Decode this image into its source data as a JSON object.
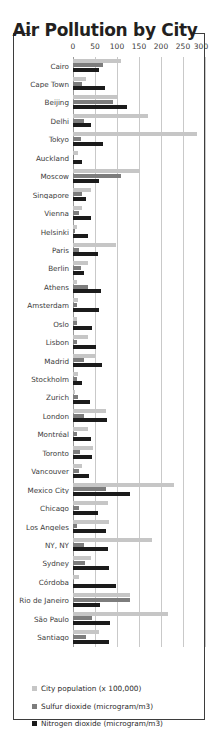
{
  "chart_data": {
    "type": "bar",
    "orientation": "horizontal",
    "title": "Air Pollution by City",
    "xlabel": "",
    "ylabel": "",
    "xlim": [
      0,
      300
    ],
    "xticks": [
      0,
      50,
      100,
      150,
      200,
      250,
      300
    ],
    "grid": true,
    "legend_position": "bottom",
    "categories": [
      "Cairo",
      "Cape Town",
      "Beijing",
      "Delhi",
      "Tokyo",
      "Auckland",
      "Moscow",
      "Singapore",
      "Vienna",
      "Helsinki",
      "Paris",
      "Berlin",
      "Athens",
      "Amsterdam",
      "Oslo",
      "Lisbon",
      "Madrid",
      "Stockholm",
      "Zurich",
      "London",
      "Montréal",
      "Toronto",
      "Vancouver",
      "Mexico City",
      "Chicago",
      "Los Angeles",
      "NY, NY",
      "Sydney",
      "Córdoba",
      "Rio de Janeiro",
      "São Paulo",
      "Santiago"
    ],
    "series": [
      {
        "name": "City population (x 100,000)",
        "color": "#c6c6c6",
        "values": [
          110,
          30,
          103,
          170,
          282,
          12,
          152,
          42,
          20,
          10,
          97,
          34,
          8,
          11,
          8,
          33,
          50,
          12,
          4,
          75,
          34,
          46,
          20,
          230,
          80,
          82,
          180,
          42,
          13,
          130,
          215,
          58
        ]
      },
      {
        "name": "Sulfur dioxide (microgram/m3)",
        "color": "#7d7d7d",
        "values": [
          69,
          21,
          90,
          24,
          18,
          3,
          109,
          20,
          14,
          4,
          14,
          18,
          34,
          10,
          8,
          8,
          24,
          10,
          11,
          25,
          10,
          17,
          14,
          74,
          14,
          9,
          26,
          28,
          1,
          129,
          43,
          29
        ]
      },
      {
        "name": "Nitrogen dioxide (microgram/m3)",
        "color": "#1b1b1b",
        "values": [
          59,
          72,
          122,
          41,
          68,
          20,
          58,
          30,
          42,
          35,
          57,
          26,
          64,
          58,
          43,
          52,
          66,
          20,
          39,
          77,
          42,
          43,
          37,
          130,
          57,
          74,
          79,
          81,
          97,
          62,
          83,
          81
        ]
      }
    ]
  },
  "legend": [
    {
      "label": "City population (x 100,000)",
      "swatch": "sw-pop"
    },
    {
      "label": "Sulfur dioxide (microgram/m3)",
      "swatch": "sw-so2"
    },
    {
      "label": "Nitrogen dioxide (microgram/m3)",
      "swatch": "sw-no2"
    }
  ]
}
